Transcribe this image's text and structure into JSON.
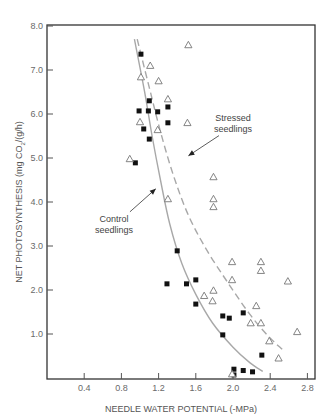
{
  "chart_data": {
    "type": "scatter",
    "title": "",
    "xlabel": "NEEDLE WATER POTENTIAL (-MPa)",
    "ylabel": "NET PHOTOSYNTHESIS (mg CO2/(g/h)",
    "ylabel_parts": {
      "before": "NET PHOTOSYNTHESIS (mg CO",
      "sub": "2",
      "after": "/(g/h)"
    },
    "xlim": [
      0,
      2.88
    ],
    "ylim": [
      0,
      8.0
    ],
    "x_ticks": [
      "0.4",
      "0.8",
      "1.2",
      "1.6",
      "2.0",
      "2.4",
      "2.8"
    ],
    "x_tick_values": [
      0.4,
      0.8,
      1.2,
      1.6,
      2.0,
      2.4,
      2.8
    ],
    "y_ticks": [
      "1.0",
      "2.0",
      "3.0",
      "4.0",
      "5.0",
      "6.0",
      "7.0",
      "8.0"
    ],
    "y_tick_values": [
      1.0,
      2.0,
      3.0,
      4.0,
      5.0,
      6.0,
      7.0,
      8.0
    ],
    "grid": false,
    "legend": "none (inline annotations)",
    "series": [
      {
        "name": "Control seedlings",
        "marker": "filled-square",
        "color": "#111111",
        "points": [
          [
            1.01,
            7.36
          ],
          [
            1.1,
            6.3
          ],
          [
            1.3,
            6.16
          ],
          [
            0.99,
            6.07
          ],
          [
            1.09,
            6.07
          ],
          [
            1.19,
            6.05
          ],
          [
            1.3,
            5.8
          ],
          [
            1.04,
            5.66
          ],
          [
            1.1,
            5.43
          ],
          [
            0.95,
            4.89
          ],
          [
            1.4,
            2.89
          ],
          [
            1.6,
            2.23
          ],
          [
            1.29,
            2.14
          ],
          [
            1.5,
            2.14
          ],
          [
            1.6,
            1.68
          ],
          [
            2.11,
            1.48
          ],
          [
            1.89,
            1.41
          ],
          [
            1.96,
            1.36
          ],
          [
            1.89,
            0.98
          ],
          [
            2.31,
            0.52
          ],
          [
            2.01,
            0.2
          ],
          [
            2.11,
            0.17
          ],
          [
            2.21,
            0.14
          ],
          [
            2.01,
            0.07
          ]
        ],
        "fit_curve": {
          "style": "solid",
          "color": "#a8a8a8",
          "points": [
            [
              0.94,
              7.7
            ],
            [
              1.05,
              6.5
            ],
            [
              1.13,
              5.5
            ],
            [
              1.22,
              4.5
            ],
            [
              1.32,
              3.5
            ],
            [
              1.45,
              2.6
            ],
            [
              1.6,
              1.9
            ],
            [
              1.78,
              1.25
            ],
            [
              2.0,
              0.7
            ],
            [
              2.18,
              0.35
            ],
            [
              2.32,
              0.15
            ]
          ]
        }
      },
      {
        "name": "Stressed seedlings",
        "marker": "open-triangle",
        "color": "#777777",
        "points": [
          [
            1.52,
            7.57
          ],
          [
            1.11,
            7.1
          ],
          [
            1.01,
            6.84
          ],
          [
            1.2,
            6.75
          ],
          [
            1.3,
            6.34
          ],
          [
            1.0,
            5.82
          ],
          [
            1.51,
            5.8
          ],
          [
            1.19,
            5.64
          ],
          [
            0.89,
            4.98
          ],
          [
            1.79,
            4.57
          ],
          [
            1.3,
            4.07
          ],
          [
            1.79,
            4.07
          ],
          [
            1.79,
            3.89
          ],
          [
            1.99,
            2.64
          ],
          [
            2.3,
            2.64
          ],
          [
            2.3,
            2.44
          ],
          [
            1.99,
            2.23
          ],
          [
            2.59,
            2.2
          ],
          [
            1.79,
            1.99
          ],
          [
            1.69,
            1.87
          ],
          [
            1.78,
            1.75
          ],
          [
            2.25,
            1.64
          ],
          [
            2.19,
            1.25
          ],
          [
            2.3,
            1.25
          ],
          [
            2.69,
            1.05
          ],
          [
            2.39,
            0.84
          ],
          [
            2.49,
            0.45
          ],
          [
            1.99,
            0.09
          ]
        ],
        "fit_curve": {
          "style": "dashed",
          "color": "#a8a8a8",
          "points": [
            [
              0.97,
              7.7
            ],
            [
              1.1,
              6.6
            ],
            [
              1.22,
              5.6
            ],
            [
              1.36,
              4.6
            ],
            [
              1.52,
              3.7
            ],
            [
              1.72,
              2.9
            ],
            [
              1.95,
              2.15
            ],
            [
              2.18,
              1.45
            ],
            [
              2.38,
              0.95
            ],
            [
              2.53,
              0.65
            ]
          ]
        }
      }
    ],
    "annotations": [
      {
        "name": "stressed-label",
        "lines": [
          "Stressed",
          "seedlings"
        ],
        "text_xy": [
          2.0,
          5.85
        ],
        "arrow_to": [
          1.52,
          5.05
        ]
      },
      {
        "name": "control-label",
        "lines": [
          "Control",
          "seedlings"
        ],
        "text_xy": [
          0.72,
          3.55
        ],
        "arrow_to": [
          1.17,
          4.3
        ]
      }
    ]
  }
}
